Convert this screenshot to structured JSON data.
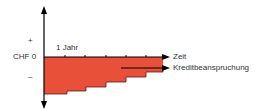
{
  "diagram": {
    "y_axis": {
      "plus_label": "+",
      "zero_label": "CHF 0",
      "minus_label": "–"
    },
    "x_axis": {
      "tick_label": "1 Jahr",
      "end_label": "Zeit"
    },
    "series_label": "Kreditbeanspruchung",
    "colors": {
      "fill": "#E8503A",
      "line": "#000000",
      "text": "#333333"
    }
  }
}
